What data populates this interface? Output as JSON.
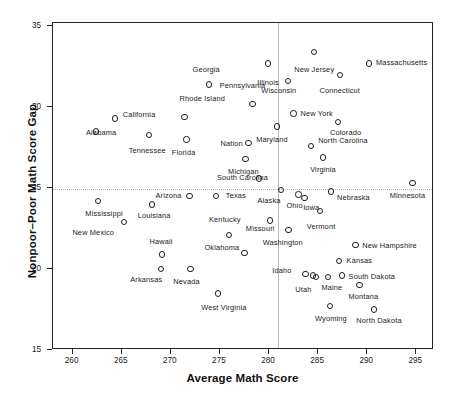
{
  "chart_data": {
    "type": "scatter",
    "title": "",
    "xlabel": "Average Math Score",
    "ylabel": "Nonpoor–Poor Math Score Gap",
    "xlim": [
      258.0,
      296.8
    ],
    "ylim": [
      15.0,
      35.2
    ],
    "xticks": [
      260,
      265,
      270,
      275,
      280,
      285,
      290,
      295
    ],
    "yticks": [
      15,
      20,
      25,
      30,
      35
    ],
    "xticklabels": [
      "260",
      "265",
      "270",
      "275",
      "280",
      "285",
      "290",
      "295"
    ],
    "yticklabels": [
      "15",
      "20",
      "25",
      "30",
      "35"
    ],
    "grid": false,
    "legend": null,
    "reference_lines": [
      {
        "orientation": "vertical",
        "x": 280.9,
        "style": "solid",
        "color": "#b9b9bd"
      },
      {
        "orientation": "horizontal",
        "y": 24.95,
        "style": "dotted",
        "color": "#b0b0b4"
      }
    ],
    "marker": {
      "shape": "circle",
      "filled": false,
      "edge_color": "#1f1f1f",
      "size": 6.4
    },
    "points": [
      {
        "label": "Illinois",
        "x": 279.9,
        "y": 32.7,
        "lx": 279.9,
        "ly": 31.5,
        "align": "center"
      },
      {
        "label": "New Jersey",
        "x": 284.6,
        "y": 33.4,
        "lx": 284.6,
        "ly": 32.3,
        "align": "center"
      },
      {
        "label": "Massachusetts",
        "x": 290.2,
        "y": 32.7,
        "lx": 290.9,
        "ly": 32.7,
        "align": "left"
      },
      {
        "label": "Connecticut",
        "x": 287.2,
        "y": 32.0,
        "lx": 287.2,
        "ly": 31.0,
        "align": "center"
      },
      {
        "label": "Wisconsin",
        "x": 281.9,
        "y": 31.6,
        "lx": 281.0,
        "ly": 31.0,
        "align": "center"
      },
      {
        "label": "Georgia",
        "x": 273.9,
        "y": 31.4,
        "lx": 273.6,
        "ly": 32.3,
        "align": "center"
      },
      {
        "label": "Pennsylvania",
        "x": 278.3,
        "y": 30.2,
        "lx": 277.3,
        "ly": 31.3,
        "align": "center"
      },
      {
        "label": "Rhode Island",
        "x": 271.4,
        "y": 29.4,
        "lx": 273.2,
        "ly": 30.5,
        "align": "center"
      },
      {
        "label": "New York",
        "x": 282.5,
        "y": 29.6,
        "lx": 283.2,
        "ly": 29.6,
        "align": "left"
      },
      {
        "label": "Colorado",
        "x": 287.0,
        "y": 29.1,
        "lx": 287.8,
        "ly": 28.4,
        "align": "center"
      },
      {
        "label": "California",
        "x": 264.3,
        "y": 29.3,
        "lx": 265.1,
        "ly": 29.5,
        "align": "left"
      },
      {
        "label": "Maryland",
        "x": 280.8,
        "y": 28.8,
        "lx": 280.3,
        "ly": 28.0,
        "align": "center"
      },
      {
        "label": "Alabama",
        "x": 262.4,
        "y": 28.5,
        "lx": 262.9,
        "ly": 28.4,
        "align": "center"
      },
      {
        "label": "Tennessee",
        "x": 267.8,
        "y": 28.3,
        "lx": 267.6,
        "ly": 27.3,
        "align": "center"
      },
      {
        "label": "Florida",
        "x": 271.6,
        "y": 28.0,
        "lx": 271.3,
        "ly": 27.2,
        "align": "center"
      },
      {
        "label": "Nation",
        "x": 277.9,
        "y": 27.8,
        "lx": 276.2,
        "ly": 27.7,
        "align": "center"
      },
      {
        "label": "North Carolina",
        "x": 284.3,
        "y": 27.6,
        "lx": 285.0,
        "ly": 27.9,
        "align": "left"
      },
      {
        "label": "Virginia",
        "x": 285.5,
        "y": 26.9,
        "lx": 285.5,
        "ly": 26.1,
        "align": "center"
      },
      {
        "label": "Michigan",
        "x": 277.6,
        "y": 26.8,
        "lx": 277.4,
        "ly": 26.0,
        "align": "center"
      },
      {
        "label": "South Carolina",
        "x": 279.0,
        "y": 25.6,
        "lx": 277.3,
        "ly": 25.6,
        "align": "center"
      },
      {
        "label": "Minnesota",
        "x": 294.6,
        "y": 25.3,
        "lx": 294.1,
        "ly": 24.5,
        "align": "center"
      },
      {
        "label": "Alaska",
        "x": 281.2,
        "y": 24.9,
        "lx": 280.0,
        "ly": 24.2,
        "align": "center"
      },
      {
        "label": "Nebraska",
        "x": 286.3,
        "y": 24.8,
        "lx": 288.6,
        "ly": 24.4,
        "align": "center"
      },
      {
        "label": "Texas",
        "x": 274.6,
        "y": 24.5,
        "lx": 275.6,
        "ly": 24.5,
        "align": "left"
      },
      {
        "label": "Arizona",
        "x": 271.9,
        "y": 24.5,
        "lx": 271.1,
        "ly": 24.5,
        "align": "right"
      },
      {
        "label": "Mississippi",
        "x": 262.6,
        "y": 24.2,
        "lx": 263.2,
        "ly": 23.4,
        "align": "center"
      },
      {
        "label": "Louisiana",
        "x": 268.1,
        "y": 24.0,
        "lx": 268.3,
        "ly": 23.3,
        "align": "center"
      },
      {
        "label": "Ohio",
        "x": 283.0,
        "y": 24.6,
        "lx": 282.6,
        "ly": 23.9,
        "align": "center"
      },
      {
        "label": "Iowa",
        "x": 283.6,
        "y": 24.4,
        "lx": 284.3,
        "ly": 23.8,
        "align": "center"
      },
      {
        "label": "Vermont",
        "x": 285.2,
        "y": 23.6,
        "lx": 285.3,
        "ly": 22.6,
        "align": "center"
      },
      {
        "label": "New Mexico",
        "x": 265.2,
        "y": 22.9,
        "lx": 262.1,
        "ly": 22.2,
        "align": "center"
      },
      {
        "label": "Missouri",
        "x": 280.1,
        "y": 23.0,
        "lx": 279.1,
        "ly": 22.5,
        "align": "center"
      },
      {
        "label": "Kentucky",
        "x": 275.9,
        "y": 22.1,
        "lx": 275.5,
        "ly": 23.0,
        "align": "center"
      },
      {
        "label": "Washington",
        "x": 282.0,
        "y": 22.4,
        "lx": 281.4,
        "ly": 21.6,
        "align": "center"
      },
      {
        "label": "Oklahoma",
        "x": 277.5,
        "y": 21.0,
        "lx": 275.2,
        "ly": 21.3,
        "align": "center"
      },
      {
        "label": "Hawaii",
        "x": 269.1,
        "y": 20.9,
        "lx": 269.0,
        "ly": 21.7,
        "align": "center"
      },
      {
        "label": "New Hampshire",
        "x": 288.8,
        "y": 21.5,
        "lx": 289.5,
        "ly": 21.4,
        "align": "left"
      },
      {
        "label": "Kansas",
        "x": 287.1,
        "y": 20.5,
        "lx": 287.9,
        "ly": 20.5,
        "align": "left"
      },
      {
        "label": "Arkansas",
        "x": 269.0,
        "y": 20.0,
        "lx": 267.5,
        "ly": 19.3,
        "align": "center"
      },
      {
        "label": "Nevada",
        "x": 272.0,
        "y": 20.0,
        "lx": 271.6,
        "ly": 19.2,
        "align": "center"
      },
      {
        "label": "Idaho",
        "x": 283.7,
        "y": 19.7,
        "lx": 282.3,
        "ly": 19.9,
        "align": "right"
      },
      {
        "label": "Utah",
        "x": 284.5,
        "y": 19.6,
        "lx": 283.5,
        "ly": 18.7,
        "align": "center"
      },
      {
        "label": "Maine",
        "x": 284.8,
        "y": 19.5,
        "lx": 286.4,
        "ly": 18.8,
        "align": "center"
      },
      {
        "label": "South Dakota",
        "x": 287.4,
        "y": 19.6,
        "lx": 288.1,
        "ly": 19.5,
        "align": "left"
      },
      {
        "label": "Montana",
        "x": 289.2,
        "y": 19.0,
        "lx": 289.6,
        "ly": 18.3,
        "align": "center"
      },
      {
        "label": "West Virginia",
        "x": 274.8,
        "y": 18.5,
        "lx": 275.4,
        "ly": 17.6,
        "align": "center"
      },
      {
        "label": "Wyoming",
        "x": 286.2,
        "y": 17.7,
        "lx": 286.3,
        "ly": 16.9,
        "align": "center"
      },
      {
        "label": "North Dakota",
        "x": 290.7,
        "y": 17.5,
        "lx": 291.2,
        "ly": 16.8,
        "align": "center"
      },
      {
        "label": "unlabeled-mid",
        "x": 286.0,
        "y": 19.5,
        "lx": null,
        "ly": null,
        "align": "center"
      }
    ]
  },
  "axis": {
    "x_title": "Average Math Score",
    "y_title": "Nonpoor–Poor Math Score Gap"
  }
}
